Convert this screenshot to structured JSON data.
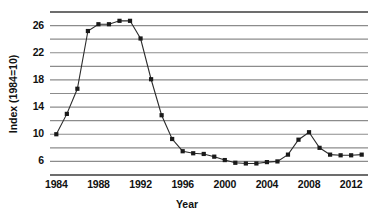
{
  "chart_data": {
    "type": "line",
    "title": "",
    "xlabel": "Year",
    "ylabel": "Index (1984=10)",
    "xlim": [
      1983.4,
      2013.6
    ],
    "ylim": [
      4,
      28
    ],
    "grid": true,
    "grid_step": 2,
    "legend": "none",
    "x_ticks": [
      "1984",
      "1988",
      "1992",
      "1996",
      "2000",
      "2004",
      "2008",
      "2012"
    ],
    "x_tick_values": [
      1984,
      1988,
      1992,
      1996,
      2000,
      2004,
      2008,
      2012
    ],
    "y_ticks": [
      "6",
      "10",
      "14",
      "18",
      "22",
      "26"
    ],
    "y_tick_values": [
      6,
      10,
      14,
      18,
      22,
      26
    ],
    "marker": "square",
    "series": [
      {
        "name": "Index (1984=10)",
        "color": "#1a1a1a",
        "x": [
          1984,
          1985,
          1986,
          1987,
          1988,
          1989,
          1990,
          1991,
          1992,
          1993,
          1994,
          1995,
          1996,
          1997,
          1998,
          1999,
          2000,
          2001,
          2002,
          2003,
          2004,
          2005,
          2006,
          2007,
          2008,
          2009,
          2010,
          2011,
          2012,
          2013
        ],
        "values": [
          10.0,
          13.0,
          16.7,
          25.2,
          26.2,
          26.2,
          26.7,
          26.7,
          24.1,
          18.1,
          12.8,
          9.3,
          7.5,
          7.2,
          7.1,
          6.7,
          6.2,
          5.8,
          5.7,
          5.7,
          5.9,
          6.0,
          7.0,
          9.2,
          10.3,
          8.0,
          7.0,
          6.9,
          6.9,
          7.0
        ]
      }
    ]
  },
  "axis": {
    "x_title": "Year",
    "y_title": "Index (1984=10)"
  }
}
